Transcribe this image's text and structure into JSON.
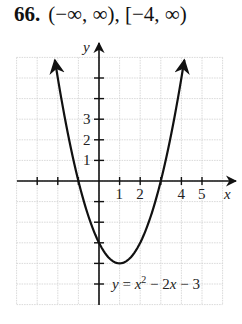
{
  "problem": {
    "number": "66.",
    "answer": "(−∞, ∞), [−4, ∞)"
  },
  "chart_data": {
    "type": "line",
    "title": "",
    "equation_label": "y = x² − 2x − 3",
    "function": "x^2 - 2x - 3",
    "xlabel": "x",
    "ylabel": "y",
    "xlim": [
      -4,
      6
    ],
    "ylim": [
      -6,
      6
    ],
    "grid": true,
    "x_tick_labels": [
      "1",
      "2",
      "4",
      "5"
    ],
    "y_tick_labels": [
      "1",
      "2",
      "3"
    ],
    "vertex": [
      1,
      -4
    ],
    "x_intercepts": [
      -1,
      3
    ],
    "y_intercept": -3,
    "series": [
      {
        "name": "y = x^2 - 2x - 3",
        "x": [
          -2.16,
          -2,
          -1,
          0,
          1,
          2,
          3,
          4,
          4.16
        ],
        "y": [
          6,
          5,
          0,
          -3,
          -4,
          -3,
          0,
          5,
          6
        ]
      }
    ],
    "domain": "(−∞, ∞)",
    "range": "[−4, ∞)"
  }
}
